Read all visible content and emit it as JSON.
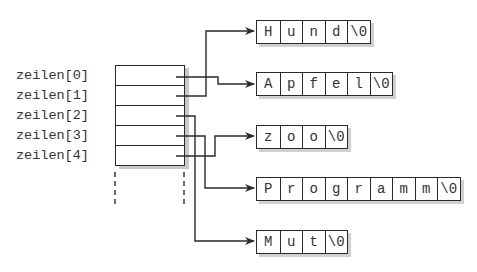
{
  "array": {
    "labels": [
      "zeilen[0]",
      "zeilen[1]",
      "zeilen[2]",
      "zeilen[3]",
      "zeilen[4]"
    ]
  },
  "strings": [
    {
      "id": "hund",
      "chars": [
        "H",
        "u",
        "n",
        "d",
        "\\0"
      ]
    },
    {
      "id": "apfel",
      "chars": [
        "A",
        "p",
        "f",
        "e",
        "l",
        "\\0"
      ]
    },
    {
      "id": "zoo",
      "chars": [
        "z",
        "o",
        "o",
        "\\0"
      ]
    },
    {
      "id": "programm",
      "chars": [
        "P",
        "r",
        "o",
        "g",
        "r",
        "a",
        "m",
        "m",
        "\\0"
      ]
    },
    {
      "id": "mut",
      "chars": [
        "M",
        "u",
        "t",
        "\\0"
      ]
    }
  ],
  "pointers": [
    {
      "from": "zeilen[0]",
      "to": "Apfel"
    },
    {
      "from": "zeilen[1]",
      "to": "Hund"
    },
    {
      "from": "zeilen[2]",
      "to": "Mut"
    },
    {
      "from": "zeilen[3]",
      "to": "Programm"
    },
    {
      "from": "zeilen[4]",
      "to": "zoo"
    }
  ],
  "colors": {
    "line": "#2a2a2a",
    "shadow": "#c8c8c8",
    "background": "#ffffff"
  }
}
